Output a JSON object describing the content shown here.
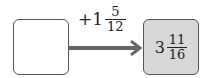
{
  "diagram": {
    "input_box": {
      "value": ""
    },
    "operation": {
      "sign": "+",
      "whole": "1",
      "numerator": "5",
      "denominator": "12"
    },
    "output_box": {
      "whole": "3",
      "numerator": "11",
      "denominator": "16"
    },
    "colors": {
      "arrow": "#666666",
      "output_fill": "#d8d8d8",
      "border": "#555555"
    }
  }
}
